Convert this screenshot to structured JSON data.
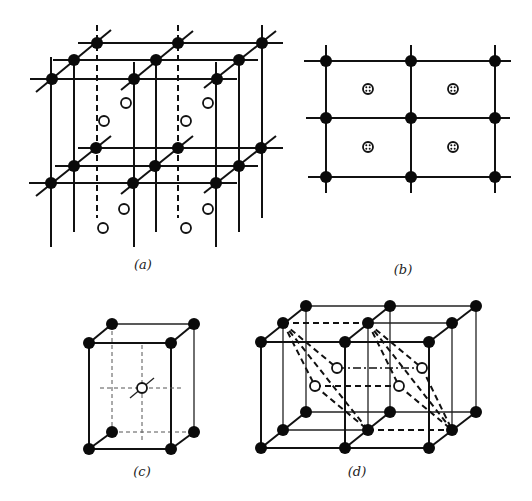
{
  "figure": {
    "panels": [
      {
        "id": "a",
        "label": "(a)",
        "description": "Layered 3D lattice of filled atoms with open-circle interstitial sites"
      },
      {
        "id": "b",
        "label": "(b)",
        "description": "2D square lattice projection with crossed-circle sites at cell centers"
      },
      {
        "id": "c",
        "label": "(c)",
        "description": "Single cubic cell with body-center open-circle site"
      },
      {
        "id": "d",
        "label": "(d)",
        "description": "Two adjoining cubic cells with dashed octahedral links and open-circle sites"
      }
    ],
    "legend": {
      "filled_circle": "lattice atom",
      "open_circle": "interstitial site",
      "crossed_circle": "projected site"
    },
    "colors": {
      "ink": "#111111",
      "background": "#ffffff"
    }
  }
}
